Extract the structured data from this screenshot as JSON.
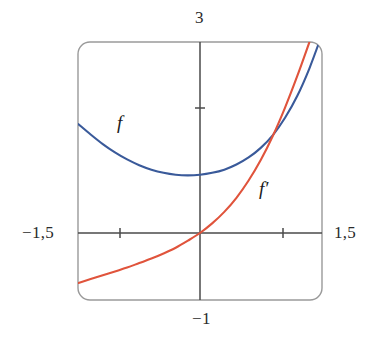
{
  "figure": {
    "kind": "function-graph",
    "frame": {
      "x": 78,
      "y": 42,
      "width": 244,
      "height": 258,
      "corner_radius": 12,
      "stroke": "#9a9a9a",
      "stroke_width": 1.4
    },
    "axes": {
      "origin_px": {
        "x": 200,
        "y": 233
      },
      "px_per_unit_x": 81,
      "px_per_unit_y": 64,
      "stroke": "#4a4a4a",
      "stroke_width": 1.5,
      "x_ticks_px": [
        120,
        283
      ],
      "y_ticks_px": [
        108
      ]
    },
    "labels": {
      "top": "3",
      "bottom": "−1",
      "left": "−1,5",
      "right": "1,5",
      "curve_f": "f",
      "curve_f_prime": "f′"
    }
  },
  "chart_data": {
    "type": "line",
    "title": "",
    "xlabel": "",
    "ylabel": "",
    "xlim": [
      -1.5,
      1.5
    ],
    "ylim": [
      -1,
      3
    ],
    "grid": false,
    "legend": "inline-curve-labels",
    "x_tick_labels": [
      "−1,5",
      "1,5"
    ],
    "y_tick_labels": [
      "−1",
      "3"
    ],
    "x_ticks": [
      -1,
      1
    ],
    "y_ticks": [
      2
    ],
    "annotations": [
      {
        "text": "f",
        "x": -0.97,
        "y": 1.85,
        "color": "#3a5a9a"
      },
      {
        "text": "f′",
        "x": 0.77,
        "y": 0.8,
        "color": "#e0543c"
      }
    ],
    "series": [
      {
        "name": "f",
        "color": "#3a5a9a",
        "x": [
          -1.5,
          -1.35,
          -1.2,
          -1.05,
          -0.9,
          -0.75,
          -0.6,
          -0.45,
          -0.3,
          -0.15,
          0.0,
          0.15,
          0.3,
          0.45,
          0.6,
          0.75,
          0.9,
          1.05,
          1.2,
          1.35,
          1.5
        ],
        "y": [
          1.7,
          1.54,
          1.39,
          1.26,
          1.15,
          1.06,
          0.99,
          0.94,
          0.91,
          0.9,
          0.91,
          0.94,
          0.99,
          1.07,
          1.18,
          1.33,
          1.53,
          1.8,
          2.14,
          2.57,
          3.08
        ]
      },
      {
        "name": "f'",
        "color": "#e0543c",
        "x": [
          -1.5,
          -1.35,
          -1.2,
          -1.05,
          -0.9,
          -0.75,
          -0.6,
          -0.45,
          -0.3,
          -0.15,
          0.0,
          0.15,
          0.3,
          0.45,
          0.6,
          0.75,
          0.9,
          1.05,
          1.2,
          1.35,
          1.5
        ],
        "y": [
          -0.78,
          -0.72,
          -0.66,
          -0.6,
          -0.54,
          -0.47,
          -0.4,
          -0.32,
          -0.23,
          -0.12,
          0.0,
          0.15,
          0.33,
          0.55,
          0.82,
          1.14,
          1.52,
          1.96,
          2.45,
          2.98,
          3.52
        ]
      }
    ]
  }
}
